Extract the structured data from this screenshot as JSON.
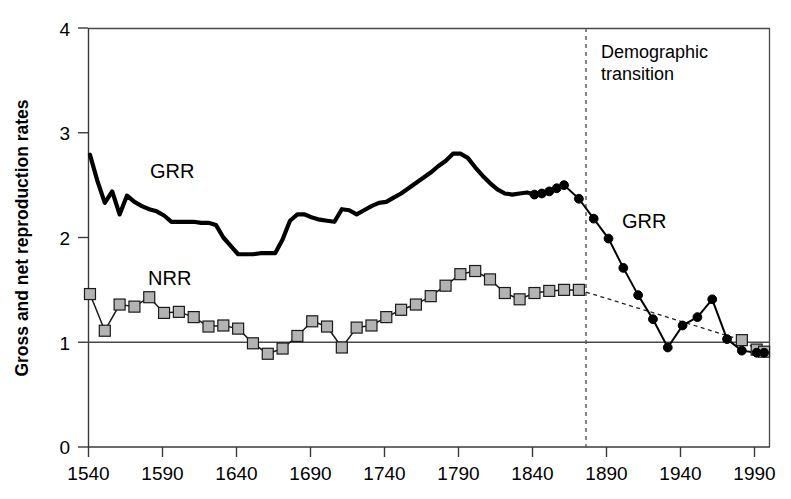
{
  "chart_data": {
    "type": "line",
    "title": "",
    "subtitle": "",
    "xlabel": "",
    "ylabel": "Gross and net reproduction rates",
    "xlim": [
      1540,
      2000
    ],
    "ylim": [
      0,
      4
    ],
    "xticks": [
      1540,
      1590,
      1640,
      1690,
      1740,
      1790,
      1840,
      1890,
      1940,
      1990
    ],
    "yticks": [
      0,
      1,
      2,
      3,
      4
    ],
    "grid": false,
    "legend_position": "inline-labels",
    "reference_lines": [
      {
        "name": "replacement-level",
        "orientation": "horizontal",
        "value": 1,
        "style": "solid"
      },
      {
        "name": "demographic-transition",
        "orientation": "vertical",
        "value": 1878,
        "style": "dashed",
        "label": "Demographic transition"
      }
    ],
    "annotations": [
      {
        "name": "grr-label-left",
        "text": "GRR",
        "x": 1580,
        "y": 2.72
      },
      {
        "name": "nrr-label-left",
        "text": "NRR",
        "x": 1578,
        "y": 1.66
      },
      {
        "name": "grr-label-right",
        "text": "GRR",
        "x": 1918,
        "y": 2.08
      },
      {
        "name": "transition-label",
        "text": "Demographic transition",
        "x": 1890,
        "y": 3.76
      }
    ],
    "series": [
      {
        "name": "GRR",
        "label": "Gross reproduction rate",
        "style": "thick-solid-line",
        "marker": "none",
        "segment": "historical",
        "x": [
          1541,
          1546,
          1551,
          1556,
          1561,
          1566,
          1571,
          1576,
          1581,
          1586,
          1591,
          1596,
          1601,
          1606,
          1611,
          1616,
          1621,
          1626,
          1631,
          1636,
          1641,
          1646,
          1651,
          1656,
          1661,
          1666,
          1671,
          1676,
          1681,
          1686,
          1691,
          1696,
          1701,
          1706,
          1711,
          1716,
          1721,
          1726,
          1731,
          1736,
          1741,
          1746,
          1751,
          1756,
          1761,
          1766,
          1771,
          1776,
          1781,
          1786,
          1791,
          1796,
          1801,
          1806,
          1811,
          1816,
          1821,
          1826,
          1831,
          1836,
          1841
        ],
        "values": [
          2.79,
          2.54,
          2.33,
          2.44,
          2.22,
          2.4,
          2.34,
          2.3,
          2.27,
          2.25,
          2.21,
          2.15,
          2.15,
          2.15,
          2.15,
          2.14,
          2.14,
          2.12,
          2.0,
          1.92,
          1.84,
          1.84,
          1.84,
          1.85,
          1.85,
          1.85,
          1.98,
          2.16,
          2.22,
          2.22,
          2.19,
          2.17,
          2.16,
          2.15,
          2.27,
          2.26,
          2.22,
          2.26,
          2.3,
          2.33,
          2.34,
          2.38,
          2.42,
          2.47,
          2.52,
          2.57,
          2.62,
          2.68,
          2.73,
          2.8,
          2.8,
          2.76,
          2.67,
          2.59,
          2.52,
          2.46,
          2.42,
          2.41,
          2.42,
          2.43,
          2.41
        ]
      },
      {
        "name": "GRR-modern",
        "label": "Gross reproduction rate (post-transition)",
        "style": "thin-solid-line",
        "marker": "filled-circle",
        "segment": "modern",
        "x": [
          1841,
          1846,
          1851,
          1856,
          1861,
          1871,
          1881,
          1891,
          1901,
          1911,
          1921,
          1931,
          1941,
          1951,
          1961,
          1971,
          1981,
          1991,
          1996
        ],
        "values": [
          2.41,
          2.42,
          2.44,
          2.47,
          2.5,
          2.37,
          2.18,
          1.99,
          1.71,
          1.45,
          1.22,
          0.95,
          1.16,
          1.24,
          1.41,
          1.03,
          0.92,
          0.9,
          0.9
        ]
      },
      {
        "name": "NRR",
        "label": "Net reproduction rate",
        "style": "thin-solid-line",
        "marker": "filled-square-gray",
        "segment": "historical",
        "x": [
          1541,
          1551,
          1561,
          1571,
          1581,
          1591,
          1601,
          1611,
          1621,
          1631,
          1641,
          1651,
          1661,
          1671,
          1681,
          1691,
          1701,
          1711,
          1721,
          1731,
          1741,
          1751,
          1761,
          1771,
          1781,
          1791,
          1801,
          1811,
          1821,
          1831,
          1841,
          1851,
          1861,
          1871
        ],
        "values": [
          1.46,
          1.11,
          1.36,
          1.34,
          1.43,
          1.28,
          1.29,
          1.24,
          1.15,
          1.16,
          1.13,
          0.99,
          0.89,
          0.94,
          1.06,
          1.2,
          1.15,
          0.95,
          1.14,
          1.16,
          1.24,
          1.31,
          1.36,
          1.44,
          1.54,
          1.65,
          1.68,
          1.6,
          1.47,
          1.41,
          1.47,
          1.49,
          1.5,
          1.5
        ]
      },
      {
        "name": "NRR-modern",
        "label": "Net reproduction rate (post-transition trend)",
        "style": "dashed-line",
        "marker": "none",
        "segment": "modern",
        "x": [
          1871,
          1981,
          1991,
          1996
        ],
        "values": [
          1.5,
          1.02,
          0.93,
          0.91
        ]
      }
    ]
  },
  "labels": {
    "y_axis_title": "Gross and net reproduction rates",
    "series_grr_left": "GRR",
    "series_nrr_left": "NRR",
    "series_grr_right": "GRR",
    "transition_line1": "Demographic",
    "transition_line2": "transition",
    "ytick_0": "0",
    "ytick_1": "1",
    "ytick_2": "2",
    "ytick_3": "3",
    "ytick_4": "4",
    "xtick_1540": "1540",
    "xtick_1590": "1590",
    "xtick_1640": "1640",
    "xtick_1690": "1690",
    "xtick_1740": "1740",
    "xtick_1790": "1790",
    "xtick_1840": "1840",
    "xtick_1890": "1890",
    "xtick_1940": "1940",
    "xtick_1990": "1990"
  },
  "colors": {
    "grr_line": "#000000",
    "nrr_marker_fill": "#b3b3b3",
    "nrr_marker_stroke": "#1a1a1a",
    "axis": "#3a3a3a",
    "transition": "#555555",
    "background": "#ffffff"
  }
}
